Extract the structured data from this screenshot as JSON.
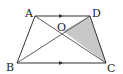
{
  "diagram": {
    "type": "geometry",
    "shape": "trapezoid",
    "points": {
      "A": {
        "label": "A",
        "x": 35,
        "y": 16,
        "label_x": 25,
        "label_y": 17
      },
      "D": {
        "label": "D",
        "x": 90,
        "y": 16,
        "label_x": 92,
        "label_y": 17
      },
      "B": {
        "label": "B",
        "x": 17,
        "y": 63,
        "label_x": 6,
        "label_y": 71
      },
      "C": {
        "label": "C",
        "x": 106,
        "y": 63,
        "label_x": 107,
        "label_y": 72
      },
      "O": {
        "label": "O",
        "x": 63,
        "y": 31,
        "label_x": 57,
        "label_y": 31
      }
    },
    "parallel_marks": [
      "AD",
      "BC"
    ],
    "shaded_region": [
      "O",
      "D",
      "C"
    ],
    "colors": {
      "stroke": "#333333",
      "shade": "#c8c8c8"
    }
  }
}
